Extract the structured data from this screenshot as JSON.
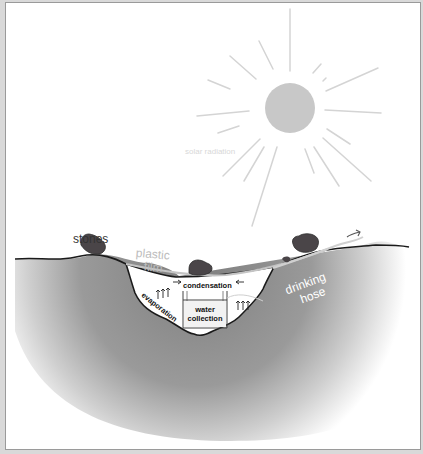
{
  "diagram": {
    "labels": {
      "solar_radiation": "solar radiation",
      "stones": "stones",
      "plastic_film_line1": "plastic",
      "plastic_film_line2": "film",
      "drinking_hose_line1": "drinking",
      "drinking_hose_line2": "hose",
      "condensation": "condensation",
      "evaporation": "evaporation",
      "water_collection_line1": "water",
      "water_collection_line2": "collection"
    },
    "colors": {
      "sun": "#c8c8c8",
      "rays": "#d4d4d4",
      "ground_dark": "#8c8c8c",
      "stone": "#4a4548",
      "outline": "#1a1a1a",
      "film": "#c4c4c4",
      "label_light": "#bdbdbd",
      "label_dark": "#333333"
    }
  }
}
